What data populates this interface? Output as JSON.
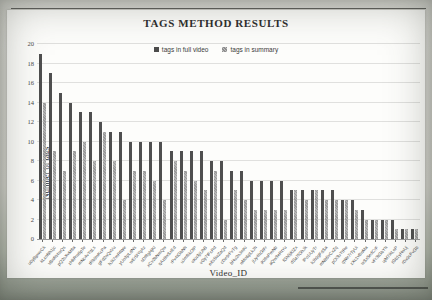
{
  "chart_data": {
    "type": "bar",
    "title": "TAGS METHOD RESULTS",
    "xlabel": "Video_ID",
    "ylabel": "Number of tags",
    "ylim": [
      0,
      20
    ],
    "yticks": [
      0,
      2,
      4,
      6,
      8,
      10,
      12,
      14,
      16,
      18,
      20
    ],
    "grid": true,
    "legend_position": "top-center",
    "colors": {
      "full_video": "#4f4f4f",
      "summary": "#a8a8a8",
      "gridline": "#e0e0de",
      "plot_background": "#fdfdfb"
    },
    "categories": [
      "u0yBpwvCk",
      "kLxoNh1jc",
      "vBnRt4wQs",
      "pQ2sXvM8a",
      "zHkRw6pTe",
      "mNc4vYqLs",
      "tRb9wKcPa",
      "gFd2nQxVu",
      "hJk7mRtWe",
      "yUo3pLdNs",
      "wEr5tYqAz",
      "sDf8gHjKl",
      "xCv2bNmQw",
      "qAz6wSxEd",
      "rFv4tGbNh",
      "uJm8ikOlP",
      "oKn3jiUhB",
      "vGy7tFcRd",
      "eXs5wZaQd",
      "cDe9rFvTg",
      "bHu2nJmKi",
      "nMo6pLkJh",
      "jUy4hGtFr",
      "iKl8oPmNb",
      "aQw3eRtYu",
      "fGh5jKlZx",
      "dSa7fGhJk",
      "lPo1iUyTr",
      "kJh9gFdSa",
      "mNb5vCxZq",
      "pOi3uYtRe",
      "qWe7rTyUi",
      "zXc1vBnMa",
      "wSx5edCrF",
      "vFr3tGbYh",
      "ujM7ikLoP",
      "tGb1yHnUj",
      "rDx9cFvGb"
    ],
    "series": [
      {
        "name": "tags in full video",
        "values": [
          19,
          17,
          15,
          14,
          13,
          13,
          12,
          11,
          11,
          10,
          10,
          10,
          10,
          9,
          9,
          9,
          9,
          8,
          8,
          7,
          7,
          6,
          6,
          6,
          6,
          5,
          5,
          5,
          5,
          5,
          4,
          4,
          3,
          2,
          2,
          2,
          1,
          1
        ]
      },
      {
        "name": "tags in summary",
        "values": [
          14,
          9,
          7,
          9,
          10,
          8,
          11,
          8,
          4,
          7,
          7,
          6,
          4,
          8,
          7,
          6,
          5,
          7,
          2,
          5,
          4,
          3,
          3,
          3,
          3,
          5,
          4,
          5,
          4,
          4,
          4,
          3,
          2,
          2,
          2,
          1,
          1,
          1
        ]
      }
    ]
  }
}
